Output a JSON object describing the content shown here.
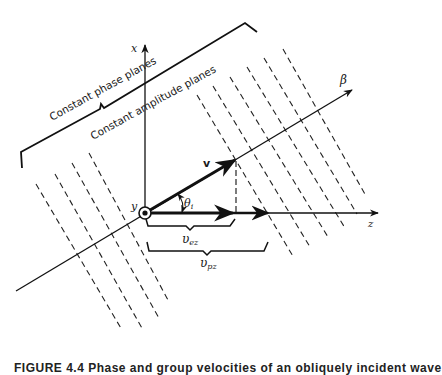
{
  "diagram": {
    "labels": {
      "constant_phase_planes": "Constant phase planes",
      "constant_amplitude_planes": "Constant amplitude planes",
      "x_axis": "x",
      "y_axis": "y",
      "z_axis": "z",
      "beta": "β",
      "velocity": "v",
      "theta": "θ",
      "theta_sub": "i",
      "v_ez": "υ",
      "v_ez_sub": "ez",
      "v_pz": "υ",
      "v_pz_sub": "pz"
    },
    "caption": "FIGURE 4.4 Phase and group velocities of an obliquely incident wave"
  }
}
